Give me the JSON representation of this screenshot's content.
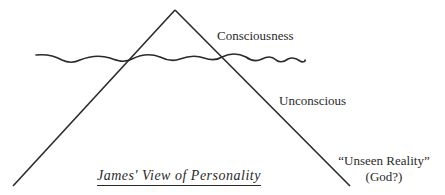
{
  "diagram": {
    "title": "James' View of Personality",
    "labels": {
      "consciousness": "Consciousness",
      "unconscious": "Unconscious",
      "unseen_reality": "“Unseen Reality”",
      "god": "(God?)"
    },
    "shapes": {
      "triangle": "inverted-V peak representing personality",
      "waterline": "wavy line separating consciousness from unconscious"
    },
    "colors": {
      "ink": "#2a2a2a",
      "background": "#ffffff"
    }
  }
}
